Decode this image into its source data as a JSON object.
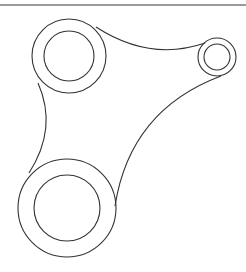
{
  "diagram": {
    "type": "mechanical-link-outline",
    "colors": {
      "stroke": "#333333",
      "top_rule": "#9a9a9a",
      "background": "#ffffff"
    },
    "bosses": [
      {
        "name": "top-left-boss",
        "cx": 69,
        "cy": 56,
        "outer_r": 37,
        "inner_r": 25
      },
      {
        "name": "right-boss",
        "cx": 217,
        "cy": 57,
        "outer_r": 19,
        "inner_r": 13
      },
      {
        "name": "bottom-boss",
        "cx": 67,
        "cy": 208,
        "outer_r": 49,
        "inner_r": 33
      }
    ],
    "edges": [
      {
        "name": "top-edge-arc",
        "d": "M 96 27 Q 150 62 205 43"
      },
      {
        "name": "right-edge-arc",
        "d": "M 221 76 Q 130 110 115 206"
      },
      {
        "name": "left-edge-arc",
        "d": "M 38 83 Q 58 128 29 173"
      }
    ]
  }
}
